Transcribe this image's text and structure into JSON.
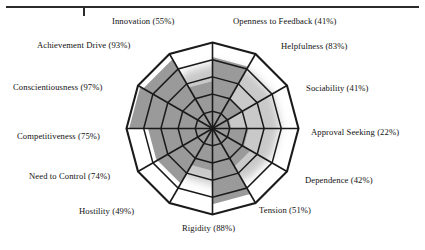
{
  "page": {
    "background_color": "#ffffff",
    "rule_color": "#2b2b2b"
  },
  "chart_data": {
    "type": "radar",
    "title": "",
    "subtitle": "",
    "xlabel": "",
    "ylabel": "",
    "grid": true,
    "legend_position": "none",
    "rings": 5,
    "ring_values": [
      20,
      40,
      60,
      80,
      100
    ],
    "value_range": [
      0,
      100
    ],
    "units": "%",
    "fill_color": "#9a9a9a",
    "line_color": "#1a1a1a",
    "categories": [
      "Openness to Feedback",
      "Helpfulness",
      "Sociability",
      "Approval Seeking",
      "Dependence",
      "Tension",
      "Rigidity",
      "Hostility",
      "Need to Control",
      "Competitiveness",
      "Conscientiousness",
      "Achievement Drive",
      "Innovation"
    ],
    "series": [
      {
        "name": "Profile",
        "values": [
          41,
          83,
          41,
          22,
          42,
          51,
          88,
          49,
          74,
          75,
          97,
          93,
          55
        ]
      }
    ],
    "labels": [
      {
        "key": "innovation",
        "text": "Innovation (55%)",
        "value": 55,
        "left": 112,
        "top": 17
      },
      {
        "key": "openness-to-feedback",
        "text": "Openness to Feedback (41%)",
        "value": 41,
        "left": 233,
        "top": 17
      },
      {
        "key": "achievement-drive",
        "text": "Achievement Drive (93%)",
        "value": 93,
        "left": 37,
        "top": 41
      },
      {
        "key": "helpfulness",
        "text": "Helpfulness (83%)",
        "value": 83,
        "left": 281,
        "top": 42
      },
      {
        "key": "conscientiousness",
        "text": "Conscientiousness (97%)",
        "value": 97,
        "left": 13,
        "top": 83
      },
      {
        "key": "sociability",
        "text": "Sociability (41%)",
        "value": 41,
        "left": 306,
        "top": 84
      },
      {
        "key": "competitiveness",
        "text": "Competitiveness (75%)",
        "value": 75,
        "left": 17,
        "top": 132
      },
      {
        "key": "approval-seeking",
        "text": "Approval Seeking (22%)",
        "value": 22,
        "left": 311,
        "top": 128
      },
      {
        "key": "need-to-control",
        "text": "Need to Control (74%)",
        "value": 74,
        "left": 29,
        "top": 172
      },
      {
        "key": "dependence",
        "text": "Dependence (42%)",
        "value": 42,
        "left": 305,
        "top": 176
      },
      {
        "key": "hostility",
        "text": "Hostility (49%)",
        "value": 49,
        "left": 79,
        "top": 207
      },
      {
        "key": "tension",
        "text": "Tension (51%)",
        "value": 51,
        "left": 259,
        "top": 206
      },
      {
        "key": "rigidity",
        "text": "Rigidity (88%)",
        "value": 88,
        "left": 182,
        "top": 224
      }
    ]
  }
}
